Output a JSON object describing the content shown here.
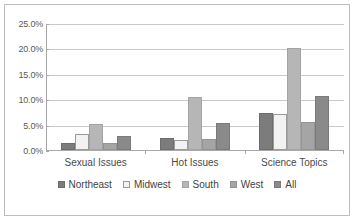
{
  "chart_data": {
    "type": "bar",
    "title": "",
    "subtitle": "",
    "xlabel": "",
    "ylabel": "",
    "categories": [
      "Sexual Issues",
      "Hot Issues",
      "Science Topics"
    ],
    "series": [
      {
        "name": "Northeast",
        "color": "#7c7c7c",
        "values": [
          1.3,
          2.3,
          7.3
        ]
      },
      {
        "name": "Midwest",
        "color": "#f2f2f2",
        "values": [
          3.2,
          1.9,
          7.0
        ]
      },
      {
        "name": "South",
        "color": "#b6b6b6",
        "values": [
          5.2,
          10.4,
          20.0
        ]
      },
      {
        "name": "West",
        "color": "#a5a5a5",
        "values": [
          1.3,
          2.2,
          5.5
        ]
      },
      {
        "name": "All",
        "color": "#8a8a8a",
        "values": [
          2.7,
          5.3,
          10.7
        ]
      }
    ],
    "ylim": [
      0,
      25
    ],
    "ytick_values": [
      0,
      5,
      10,
      15,
      20,
      25
    ],
    "ytick_labels": [
      "0.0%",
      "5.0%",
      "10.0%",
      "15.0%",
      "20.0%",
      "25.0%"
    ],
    "grid": "horizontal",
    "legend_position": "bottom",
    "value_unit": "percent"
  },
  "axis": {
    "ticks": [
      {
        "label": "25.0%",
        "value": 25
      },
      {
        "label": "20.0%",
        "value": 20
      },
      {
        "label": "15.0%",
        "value": 15
      },
      {
        "label": "10.0%",
        "value": 10
      },
      {
        "label": "5.0%",
        "value": 5
      },
      {
        "label": "0.0%",
        "value": 0
      }
    ]
  },
  "categories": [
    {
      "label": "Sexual Issues"
    },
    {
      "label": "Hot Issues"
    },
    {
      "label": "Science Topics"
    }
  ],
  "legend": {
    "items": [
      {
        "label": "Northeast",
        "color": "#7c7c7c",
        "swatch": "filled-dark"
      },
      {
        "label": "Midwest",
        "color": "#f2f2f2",
        "swatch": "outlined-light"
      },
      {
        "label": "South",
        "color": "#b6b6b6",
        "swatch": "filled-light"
      },
      {
        "label": "West",
        "color": "#a5a5a5",
        "swatch": "filled-mid"
      },
      {
        "label": "All",
        "color": "#8a8a8a",
        "swatch": "filled-dark-mid"
      }
    ]
  }
}
